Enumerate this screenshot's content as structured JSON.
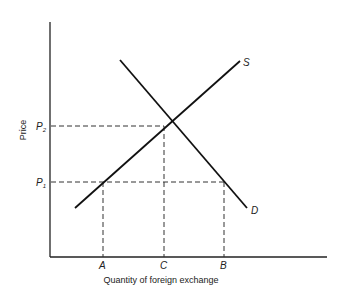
{
  "diagram": {
    "axes": {
      "x_label": "Quantity of foreign exchange",
      "y_label": "Price"
    },
    "price_levels": [
      {
        "name": "P",
        "sub": "1"
      },
      {
        "name": "P",
        "sub": "2"
      }
    ],
    "quantity_marks": [
      "A",
      "C",
      "B"
    ],
    "curves": {
      "supply_label": "S",
      "demand_label": "D"
    },
    "colors": {
      "line": "#111111",
      "dashed": "#333333",
      "background": "#ffffff"
    }
  }
}
